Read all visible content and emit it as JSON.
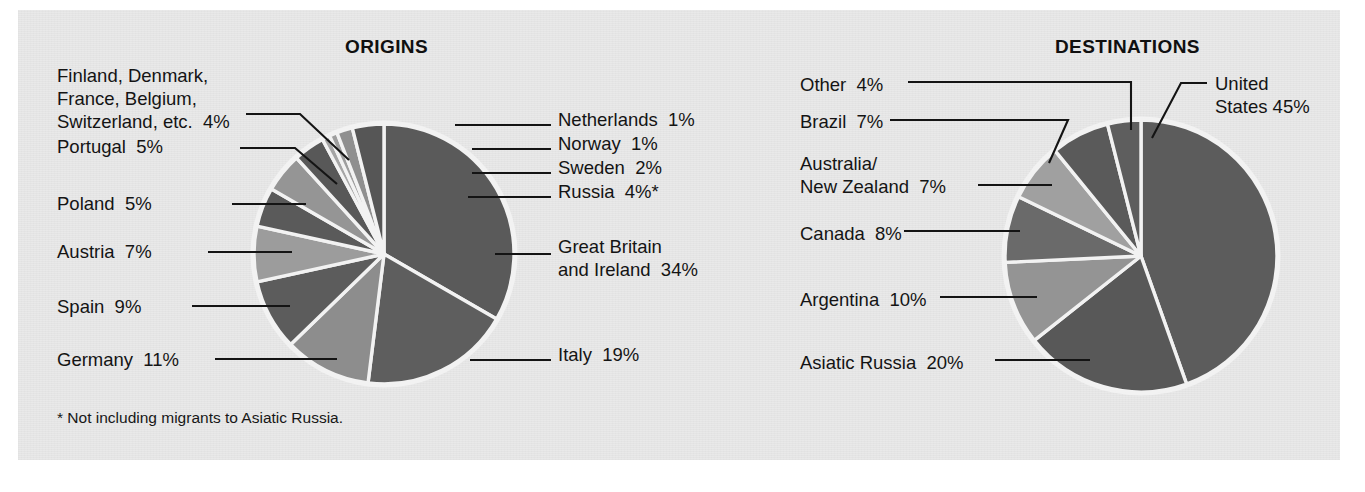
{
  "figure": {
    "background_color": "#ffffff",
    "panel_color": "#e9e9e9",
    "footnote": "* Not including migrants to Asiatic Russia."
  },
  "origins": {
    "title": "ORIGINS",
    "labels": {
      "nordic_group": "Finland, Denmark,\nFrance, Belgium,\nSwitzerland, etc.  4%",
      "portugal": "Portugal  5%",
      "poland": "Poland  5%",
      "austria": "Austria  7%",
      "spain": "Spain  9%",
      "germany": "Germany  11%",
      "netherlands": "Netherlands  1%",
      "norway": "Norway  1%",
      "sweden": "Sweden  2%",
      "russia": "Russia  4%*",
      "great_britain": "Great Britain\nand Ireland  34%",
      "italy": "Italy  19%"
    }
  },
  "destinations": {
    "title": "DESTINATIONS",
    "labels": {
      "other": "Other  4%",
      "brazil": "Brazil  7%",
      "australia_nz": "Australia/\nNew Zealand  7%",
      "canada": "Canada  8%",
      "argentina": "Argentina  10%",
      "asiatic_russia": "Asiatic Russia  20%",
      "united_states": "United\nStates 45%"
    }
  },
  "chart_data": [
    {
      "type": "pie",
      "title": "ORIGINS",
      "unit": "percent",
      "note": "* Not including migrants to Asiatic Russia.",
      "start_angle_deg": 0,
      "direction": "clockwise",
      "categories": [
        "Great Britain and Ireland",
        "Italy",
        "Germany",
        "Spain",
        "Austria",
        "Poland",
        "Portugal",
        "Finland, Denmark, France, Belgium, Switzerland, etc.",
        "Netherlands",
        "Norway",
        "Sweden",
        "Russia"
      ],
      "values": [
        34,
        19,
        11,
        9,
        7,
        5,
        5,
        4,
        1,
        1,
        2,
        4
      ],
      "slice_colors": [
        "#5a5a5a",
        "#5e5e5e",
        "#8d8d8d",
        "#5c5c5c",
        "#9c9c9c",
        "#5a5a5a",
        "#959595",
        "#585858",
        "#a5a5a5",
        "#9e9e9e",
        "#8f8f8f",
        "#565656"
      ],
      "legend_position": "callout-labels"
    },
    {
      "type": "pie",
      "title": "DESTINATIONS",
      "unit": "percent",
      "start_angle_deg": 0,
      "direction": "clockwise",
      "categories": [
        "United States",
        "Asiatic Russia",
        "Argentina",
        "Canada",
        "Australia/New Zealand",
        "Brazil",
        "Other"
      ],
      "values": [
        45,
        20,
        10,
        8,
        7,
        7,
        4
      ],
      "slice_colors": [
        "#5c5c5c",
        "#585858",
        "#949494",
        "#6a6a6a",
        "#a0a0a0",
        "#5a5a5a",
        "#5e5e5e"
      ],
      "legend_position": "callout-labels"
    }
  ]
}
